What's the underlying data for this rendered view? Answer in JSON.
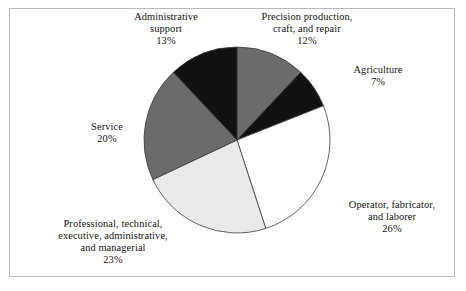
{
  "figure": {
    "frame_border_color": "#b9b9b9",
    "background_color": "#ffffff"
  },
  "chart_data": {
    "type": "pie",
    "title": "",
    "subtitle": "",
    "xlabel": "",
    "ylabel": "",
    "legend_position": "none",
    "grid": false,
    "start_angle_deg": 0,
    "direction": "clockwise",
    "units": "percent",
    "total": 101,
    "center": {
      "x": 237,
      "y": 140
    },
    "radius": 93,
    "categories": [
      "Precision production, craft, and repair",
      "Agriculture",
      "Operator, fabricator, and laborer",
      "Professional, technical, executive, administrative, and managerial",
      "Service",
      "Administrative support"
    ],
    "values": [
      12,
      7,
      26,
      23,
      20,
      13
    ],
    "slices": [
      {
        "name": "Precision production, craft, and repair",
        "label_lines": [
          "Precision production,",
          "craft, and repair"
        ],
        "value": 12,
        "percent_label": "12%",
        "color": "#6b6b6b",
        "start_angle_deg": 0.0,
        "end_angle_deg": 43.2
      },
      {
        "name": "Agriculture",
        "label_lines": [
          "Agriculture"
        ],
        "value": 7,
        "percent_label": "7%",
        "color": "#111111",
        "start_angle_deg": 43.2,
        "end_angle_deg": 68.4
      },
      {
        "name": "Operator, fabricator, and laborer",
        "label_lines": [
          "Operator, fabricator,",
          "and laborer"
        ],
        "value": 26,
        "percent_label": "26%",
        "color": "#ffffff",
        "start_angle_deg": 68.4,
        "end_angle_deg": 162.0
      },
      {
        "name": "Professional, technical, executive, administrative, and managerial",
        "label_lines": [
          "Professional, technical,",
          "executive, administrative,",
          "and managerial"
        ],
        "value": 23,
        "percent_label": "23%",
        "color": "#e9e9e9",
        "start_angle_deg": 162.0,
        "end_angle_deg": 244.8
      },
      {
        "name": "Service",
        "label_lines": [
          "Service"
        ],
        "value": 20,
        "percent_label": "20%",
        "color": "#6b6b6b",
        "start_angle_deg": 244.8,
        "end_angle_deg": 316.8
      },
      {
        "name": "Administrative support",
        "label_lines": [
          "Administrative",
          "support"
        ],
        "value": 13,
        "percent_label": "13%",
        "color": "#111111",
        "start_angle_deg": 316.8,
        "end_angle_deg": 360.0
      }
    ]
  },
  "labels": {
    "administrative_support": {
      "line1": "Administrative",
      "line2": "support",
      "percent": "13%"
    },
    "precision_production": {
      "line1": "Precision production,",
      "line2": "craft, and repair",
      "percent": "12%"
    },
    "agriculture": {
      "line1": "Agriculture",
      "percent": "7%"
    },
    "operator": {
      "line1": "Operator, fabricator,",
      "line2": "and laborer",
      "percent": "26%"
    },
    "professional": {
      "line1": "Professional, technical,",
      "line2": "executive, administrative,",
      "line3": "and managerial",
      "percent": "23%"
    },
    "service": {
      "line1": "Service",
      "percent": "20%"
    }
  }
}
